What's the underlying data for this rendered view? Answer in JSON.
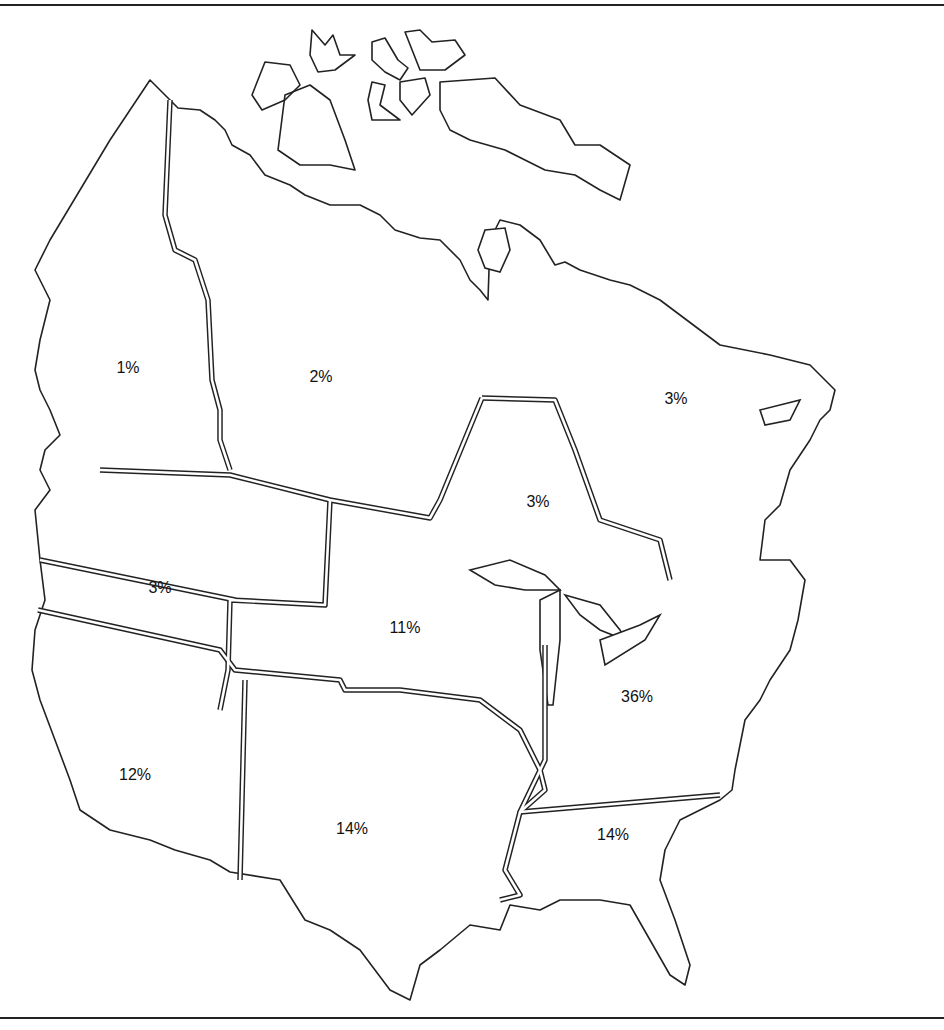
{
  "figure": {
    "type": "regional-percentage-map",
    "regions": [
      {
        "id": "alaska-yukon",
        "label": "1%",
        "x": 128,
        "y": 368
      },
      {
        "id": "northwest-territories",
        "label": "2%",
        "x": 321,
        "y": 377
      },
      {
        "id": "eastern-canada",
        "label": "3%",
        "x": 676,
        "y": 399
      },
      {
        "id": "ontario-north",
        "label": "3%",
        "x": 538,
        "y": 502
      },
      {
        "id": "pacific-northwest",
        "label": "3%",
        "x": 160,
        "y": 588
      },
      {
        "id": "central-north",
        "label": "11%",
        "x": 405,
        "y": 628
      },
      {
        "id": "northeast",
        "label": "36%",
        "x": 637,
        "y": 697
      },
      {
        "id": "west",
        "label": "12%",
        "x": 135,
        "y": 775
      },
      {
        "id": "south-central",
        "label": "14%",
        "x": 352,
        "y": 829
      },
      {
        "id": "southeast",
        "label": "14%",
        "x": 613,
        "y": 835
      }
    ]
  }
}
